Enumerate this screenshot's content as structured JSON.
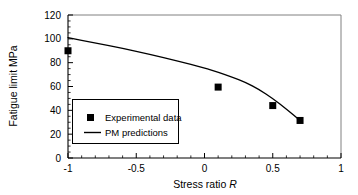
{
  "chart_data": {
    "type": "scatter",
    "title": "",
    "xlabel": "Stress ratio R",
    "ylabel": "Fatigue limit MPa",
    "xlim": [
      -1,
      1
    ],
    "ylim": [
      0,
      120
    ],
    "grid": false,
    "x_ticks": [
      -1,
      -0.5,
      0,
      0.5,
      1
    ],
    "x_tick_labels": [
      "-1",
      "-0.5",
      "0",
      "0.5",
      "1"
    ],
    "x_minor_tick_step": 0.1,
    "y_ticks": [
      0,
      20,
      40,
      60,
      80,
      100,
      120
    ],
    "y_tick_labels": [
      "0",
      "20",
      "40",
      "60",
      "80",
      "100",
      "120"
    ],
    "y_minor_tick_step": 5,
    "legend_position": "center-left",
    "series": [
      {
        "name": "Experimental data",
        "type": "scatter",
        "marker": "square",
        "color": "#000000",
        "x": [
          -1.0,
          0.1,
          0.5,
          0.7
        ],
        "y": [
          90,
          59.5,
          44,
          31.5
        ]
      },
      {
        "name": "PM predictions",
        "type": "line",
        "color": "#000000",
        "x": [
          -1.0,
          -0.8,
          -0.6,
          -0.4,
          -0.2,
          0.0,
          0.1,
          0.2,
          0.3,
          0.4,
          0.5,
          0.6,
          0.7
        ],
        "y": [
          101,
          96.5,
          92,
          87,
          81.5,
          75.5,
          72,
          68,
          63.5,
          57.5,
          50,
          41,
          31.5
        ]
      }
    ]
  },
  "axis": {
    "x_title_main": "Stress ratio ",
    "x_title_symbol": "R",
    "y_title": "Fatigue limit MPa"
  },
  "legend": {
    "entries": [
      {
        "label": "Experimental data",
        "marker": "square"
      },
      {
        "label": "PM predictions",
        "marker": "line"
      }
    ]
  },
  "colors": {
    "axis": "#000000",
    "data": "#000000",
    "background": "#ffffff"
  }
}
